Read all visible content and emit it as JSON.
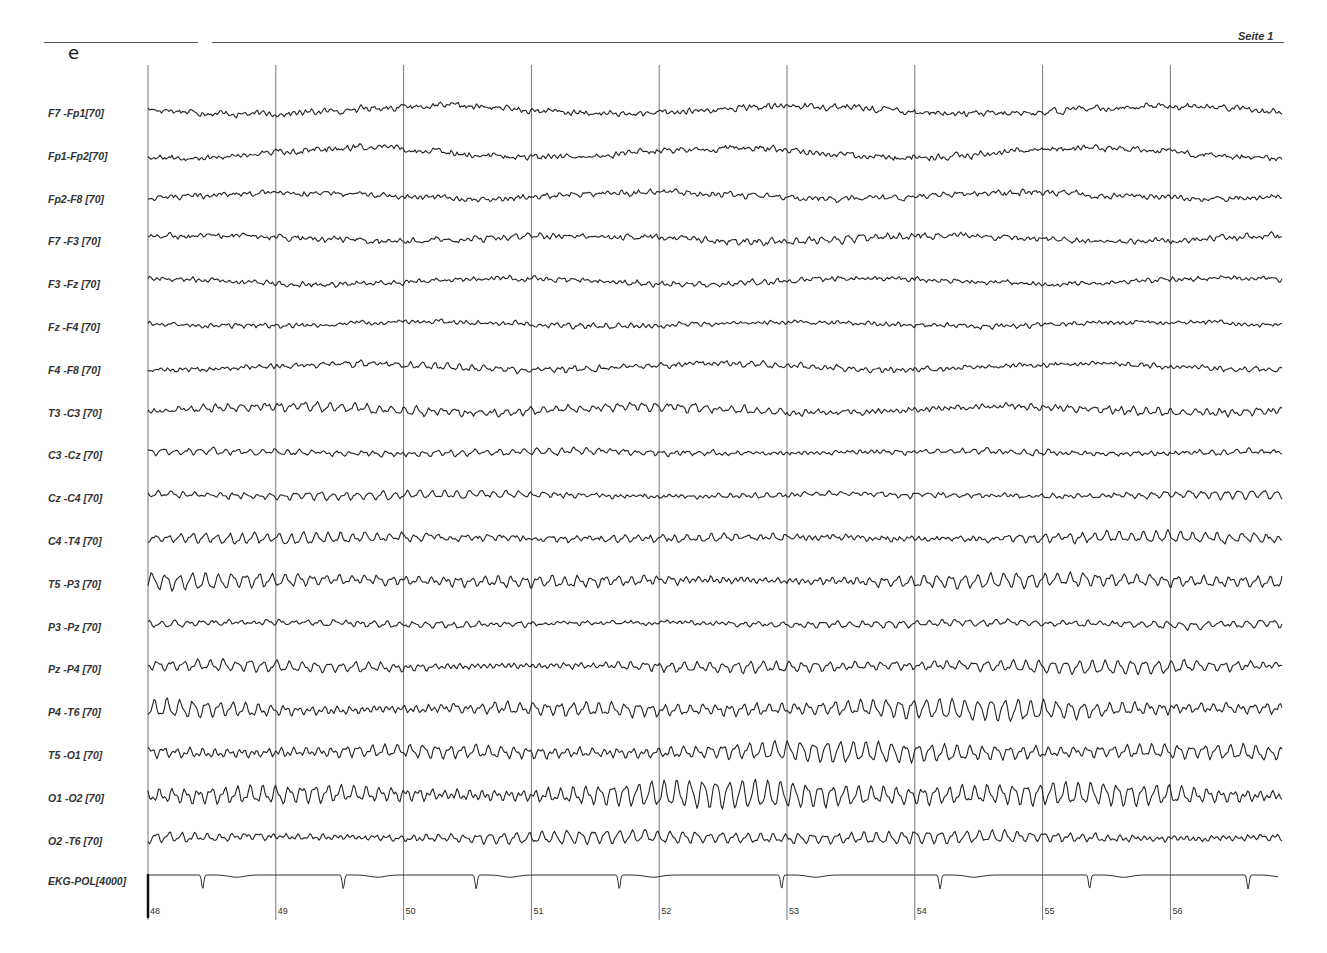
{
  "header": {
    "page_label": "Seite 1",
    "panel_letter": "e"
  },
  "chart_data": {
    "type": "line",
    "title": "",
    "xlabel": "time (s)",
    "ylabel": "",
    "x_ticks": [
      "48",
      "49",
      "50",
      "51",
      "52",
      "53",
      "54",
      "55",
      "56"
    ],
    "x_range": [
      48,
      56.9
    ],
    "grid": "vertical lines at each second",
    "legend": "none; channel labels on left",
    "series": [
      {
        "name": "F7 -Fp1[70]",
        "sensitivity": 70,
        "character": "low-amplitude fast activity with slow drift",
        "amp": 3,
        "alpha": 1.2,
        "noise": 2.5,
        "drift": 4
      },
      {
        "name": "Fp1-Fp2[70]",
        "sensitivity": 70,
        "character": "low-amplitude fast activity with slow drift",
        "amp": 3,
        "alpha": 1.0,
        "noise": 2.5,
        "drift": 5
      },
      {
        "name": "Fp2-F8 [70]",
        "sensitivity": 70,
        "character": "low-amplitude fast activity",
        "amp": 3,
        "alpha": 1.5,
        "noise": 2.2,
        "drift": 3
      },
      {
        "name": "F7 -F3 [70]",
        "sensitivity": 70,
        "character": "low-amplitude mixed activity",
        "amp": 3,
        "alpha": 2.0,
        "noise": 2.2,
        "drift": 3
      },
      {
        "name": "F3 -Fz [70]",
        "sensitivity": 70,
        "character": "low-amplitude mixed activity",
        "amp": 3,
        "alpha": 1.5,
        "noise": 1.8,
        "drift": 3
      },
      {
        "name": "Fz -F4 [70]",
        "sensitivity": 70,
        "character": "low-amplitude mixed activity",
        "amp": 3,
        "alpha": 1.5,
        "noise": 1.6,
        "drift": 2
      },
      {
        "name": "F4 -F8 [70]",
        "sensitivity": 70,
        "character": "low-amplitude mixed activity",
        "amp": 3,
        "alpha": 2.5,
        "noise": 1.8,
        "drift": 3
      },
      {
        "name": "T3 -C3 [70]",
        "sensitivity": 70,
        "character": "theta/alpha mixed",
        "amp": 4,
        "alpha": 4.0,
        "noise": 1.8,
        "drift": 3
      },
      {
        "name": "C3 -Cz [70]",
        "sensitivity": 70,
        "character": "low-amplitude alpha",
        "amp": 3,
        "alpha": 3.0,
        "noise": 1.5,
        "drift": 1
      },
      {
        "name": "Cz -C4 [70]",
        "sensitivity": 70,
        "character": "low-amplitude alpha",
        "amp": 3,
        "alpha": 3.5,
        "noise": 1.4,
        "drift": 1
      },
      {
        "name": "C4 -T4 [70]",
        "sensitivity": 70,
        "character": "alpha with fast components",
        "amp": 4,
        "alpha": 4.5,
        "noise": 2.0,
        "drift": 1
      },
      {
        "name": "T5 -P3 [70]",
        "sensitivity": 70,
        "character": "waxing-waning alpha",
        "amp": 6,
        "alpha": 7.0,
        "noise": 1.2,
        "drift": 1
      },
      {
        "name": "P3 -Pz [70]",
        "sensitivity": 70,
        "character": "low-amplitude alpha",
        "amp": 3,
        "alpha": 3.5,
        "noise": 1.4,
        "drift": 1
      },
      {
        "name": "Pz -P4 [70]",
        "sensitivity": 70,
        "character": "alpha rhythm",
        "amp": 5,
        "alpha": 6.0,
        "noise": 1.2,
        "drift": 1
      },
      {
        "name": "P4 -T6 [70]",
        "sensitivity": 70,
        "character": "prominent alpha rhythm",
        "amp": 7,
        "alpha": 9.0,
        "noise": 1.2,
        "drift": 1
      },
      {
        "name": "T5 -O1 [70]",
        "sensitivity": 70,
        "character": "prominent alpha rhythm",
        "amp": 7,
        "alpha": 9.0,
        "noise": 1.2,
        "drift": 1
      },
      {
        "name": "O1 -O2 [70]",
        "sensitivity": 70,
        "character": "high-amplitude alpha rhythm (~9-10 Hz)",
        "amp": 9,
        "alpha": 13.0,
        "noise": 1.0,
        "drift": 1
      },
      {
        "name": "O2 -T6 [70]",
        "sensitivity": 70,
        "character": "alpha rhythm",
        "amp": 5,
        "alpha": 6.5,
        "noise": 1.3,
        "drift": 1
      }
    ],
    "ekg": {
      "name": "EKG-POL[4000]",
      "sensitivity": 4000,
      "beat_times_s": [
        48.42,
        49.52,
        50.56,
        51.68,
        52.95,
        54.19,
        55.36,
        56.6
      ],
      "character": "flat baseline with negative QRS deflections"
    }
  }
}
